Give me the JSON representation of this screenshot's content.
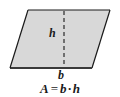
{
  "figure": {
    "type": "geometry-diagram",
    "shape_name": "parallelogram",
    "background_color": "#ffffff",
    "fill_color": "#d8d8d8",
    "stroke_color": "#1a1a1a",
    "labels": {
      "height": "h",
      "base": "b"
    },
    "dashed_line": {
      "name": "height-segment",
      "orientation": "vertical",
      "dash_pattern": "4 3"
    },
    "formula": {
      "result": "A",
      "equals": "=",
      "factor_1": "b",
      "operator": "·",
      "factor_2": "h",
      "full_text": "A = b · h"
    }
  }
}
